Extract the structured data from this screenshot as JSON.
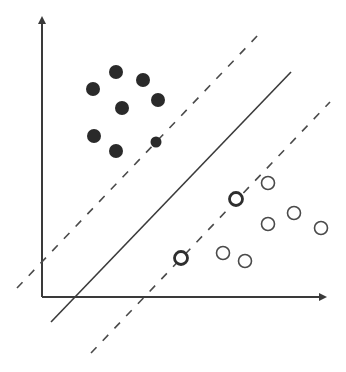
{
  "diagram": {
    "type": "svm-maximum-margin",
    "colors": {
      "background": "#ffffff",
      "stroke": "#3a3a3a",
      "filled_point": "#2a2a2a",
      "open_point_stroke": "#4a4a4a"
    },
    "axes": {
      "origin": [
        42,
        297
      ],
      "y_axis_top": [
        42,
        18
      ],
      "x_axis_right": [
        325,
        297
      ]
    },
    "hyperplane": {
      "x1": 51,
      "y1": 322,
      "x2": 291,
      "y2": 72
    },
    "margin_upper": {
      "x1": 17,
      "y1": 288,
      "x2": 260,
      "y2": 33
    },
    "margin_lower": {
      "x1": 91,
      "y1": 353,
      "x2": 330,
      "y2": 102
    },
    "class_filled": [
      {
        "cx": 93,
        "cy": 89,
        "r": 7
      },
      {
        "cx": 116,
        "cy": 72,
        "r": 7
      },
      {
        "cx": 143,
        "cy": 80,
        "r": 7
      },
      {
        "cx": 158,
        "cy": 100,
        "r": 7
      },
      {
        "cx": 122,
        "cy": 108,
        "r": 7
      },
      {
        "cx": 94,
        "cy": 136,
        "r": 7
      },
      {
        "cx": 116,
        "cy": 151,
        "r": 7
      },
      {
        "cx": 156,
        "cy": 142,
        "r": 5.5,
        "support_vector": true
      }
    ],
    "class_open": [
      {
        "cx": 268,
        "cy": 183,
        "r": 6.5
      },
      {
        "cx": 236,
        "cy": 199,
        "r": 6.5,
        "support_vector": true
      },
      {
        "cx": 294,
        "cy": 213,
        "r": 6.5
      },
      {
        "cx": 268,
        "cy": 224,
        "r": 6.5
      },
      {
        "cx": 321,
        "cy": 228,
        "r": 6.5
      },
      {
        "cx": 181,
        "cy": 258,
        "r": 6.5,
        "support_vector": true
      },
      {
        "cx": 223,
        "cy": 253,
        "r": 6.5
      },
      {
        "cx": 245,
        "cy": 261,
        "r": 6.5
      }
    ]
  }
}
